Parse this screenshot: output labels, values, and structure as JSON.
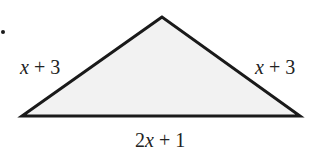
{
  "diagram": {
    "type": "isosceles-triangle",
    "shape": {
      "vertices": {
        "apex": [
          162,
          17
        ],
        "bottom_left": [
          22,
          116
        ],
        "bottom_right": [
          300,
          116
        ]
      },
      "fill_color": "#f2f2f2",
      "stroke_color": "#1a1a1a"
    },
    "labels": {
      "left_side": {
        "coef": "x",
        "rest": " + 3"
      },
      "right_side": {
        "coef": "x",
        "rest": " + 3"
      },
      "base": {
        "num": "2",
        "coef": "x",
        "rest": " + 1"
      }
    },
    "bullet_dot": true
  }
}
